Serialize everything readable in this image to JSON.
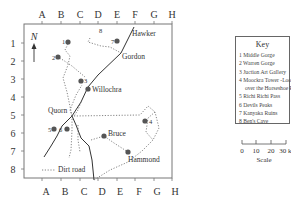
{
  "map": {
    "columns": [
      "A",
      "B",
      "C",
      "D",
      "E",
      "F",
      "G",
      "H"
    ],
    "rows": [
      "1",
      "2",
      "3",
      "4",
      "5",
      "6",
      "7",
      "8"
    ],
    "north_label": "N",
    "towns": [
      {
        "name": "Hawker"
      },
      {
        "name": "Gordon"
      },
      {
        "name": "Willochra"
      },
      {
        "name": "Quorn"
      },
      {
        "name": "Bruce"
      },
      {
        "name": "Hammond"
      }
    ],
    "sites": [
      {
        "number": "1"
      },
      {
        "number": "2"
      },
      {
        "number": "3"
      },
      {
        "number": "4"
      },
      {
        "number": "5"
      },
      {
        "number": "6"
      },
      {
        "number": "7"
      },
      {
        "number": "8"
      }
    ],
    "dirt_road_label": "Dirt road"
  },
  "key": {
    "title": "Key",
    "items": [
      "1 Middle Gorge",
      "2 Warren Gorge",
      "3 Juction Art Gallery",
      "4 Moockra Tower -Lookout",
      "over the Horseshoe Ranges",
      "5 Richi Richi Pass",
      "6 Devils Peaks",
      "7 Kanyaka Ruins",
      "8 Ben's Cave"
    ]
  },
  "scale": {
    "ticks": [
      "0",
      "10",
      "20",
      "30 km"
    ],
    "label": "Scale"
  }
}
